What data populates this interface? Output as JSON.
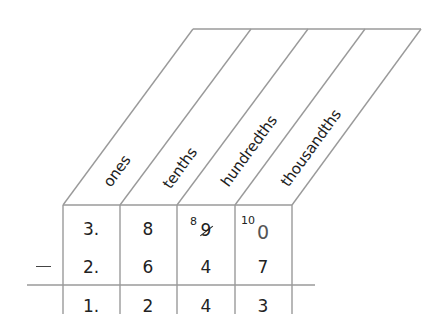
{
  "diagram": {
    "type": "place-value-subtraction",
    "operator": "−",
    "columns": [
      {
        "label": "ones"
      },
      {
        "label": "tenths"
      },
      {
        "label": "hundredths"
      },
      {
        "label": "thousandths"
      }
    ],
    "rows": {
      "minuend": {
        "ones": "3.",
        "tenths": "8",
        "hundredths": {
          "regroup_superscript": "8",
          "original": "9",
          "crossed_out": true
        },
        "thousandths": {
          "regroup_superscript": "10",
          "original": "0",
          "crossed_out": false
        }
      },
      "subtrahend": {
        "ones": "2.",
        "tenths": "6",
        "hundredths": "4",
        "thousandths": "7"
      },
      "difference": {
        "ones": "1.",
        "tenths": "2",
        "hundredths": "4",
        "thousandths": "3"
      }
    },
    "colors": {
      "lines": "#9a9a9a",
      "text": "#222222"
    }
  }
}
